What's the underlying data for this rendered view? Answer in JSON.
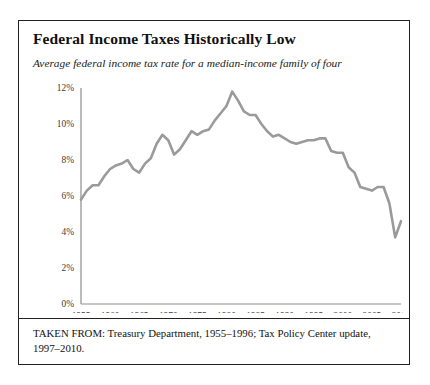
{
  "figure": {
    "title": "Federal Income Taxes Historically Low",
    "subtitle": "Average federal income tax rate for a median-income family of four",
    "caption": "TAKEN FROM: Treasury Department, 1955–1996; Tax Policy Center update, 1997–2010.",
    "border_color": "#231f20",
    "background": "#ffffff"
  },
  "chart_data": {
    "type": "line",
    "title": "Federal Income Taxes Historically Low",
    "subtitle": "Average federal income tax rate for a median-income family of four",
    "xlabel": "",
    "ylabel": "",
    "xlim": [
      1955,
      2010
    ],
    "ylim": [
      0,
      12
    ],
    "grid": false,
    "legend": "none",
    "line_color": "#9a9a9a",
    "line_width": 2.6,
    "y_ticks": [
      0,
      2,
      4,
      6,
      8,
      10,
      12
    ],
    "y_tick_labels": [
      "0%",
      "2%",
      "4%",
      "6%",
      "8%",
      "10%",
      "12%"
    ],
    "x_ticks": [
      1955,
      1960,
      1965,
      1970,
      1975,
      1980,
      1985,
      1990,
      1995,
      2000,
      2005,
      2010
    ],
    "x_tick_labels": [
      "1955",
      "1960",
      "1965",
      "1970",
      "1975",
      "1980",
      "1985",
      "1990",
      "1995",
      "2000",
      "2005",
      "2010"
    ],
    "x": [
      1955,
      1956,
      1957,
      1958,
      1959,
      1960,
      1961,
      1962,
      1963,
      1964,
      1965,
      1966,
      1967,
      1968,
      1969,
      1970,
      1971,
      1972,
      1973,
      1974,
      1975,
      1976,
      1977,
      1978,
      1979,
      1980,
      1981,
      1982,
      1983,
      1984,
      1985,
      1986,
      1987,
      1988,
      1989,
      1990,
      1991,
      1992,
      1993,
      1994,
      1995,
      1996,
      1997,
      1998,
      1999,
      2000,
      2001,
      2002,
      2003,
      2004,
      2005,
      2006,
      2007,
      2008,
      2009,
      2010
    ],
    "values": [
      5.8,
      6.3,
      6.6,
      6.6,
      7.1,
      7.5,
      7.7,
      7.8,
      8.0,
      7.5,
      7.3,
      7.8,
      8.1,
      8.9,
      9.4,
      9.1,
      8.3,
      8.6,
      9.1,
      9.6,
      9.4,
      9.6,
      9.7,
      10.2,
      10.6,
      11.0,
      11.8,
      11.3,
      10.7,
      10.5,
      10.5,
      10.0,
      9.6,
      9.3,
      9.4,
      9.2,
      9.0,
      8.9,
      9.0,
      9.1,
      9.1,
      9.2,
      9.2,
      8.5,
      8.4,
      8.4,
      7.6,
      7.3,
      6.5,
      6.4,
      6.3,
      6.5,
      6.5,
      5.6,
      3.7,
      4.6
    ],
    "series": [
      {
        "name": "Average federal income tax rate",
        "values": [
          5.8,
          6.3,
          6.6,
          6.6,
          7.1,
          7.5,
          7.7,
          7.8,
          8.0,
          7.5,
          7.3,
          7.8,
          8.1,
          8.9,
          9.4,
          9.1,
          8.3,
          8.6,
          9.1,
          9.6,
          9.4,
          9.6,
          9.7,
          10.2,
          10.6,
          11.0,
          11.8,
          11.3,
          10.7,
          10.5,
          10.5,
          10.0,
          9.6,
          9.3,
          9.4,
          9.2,
          9.0,
          8.9,
          9.0,
          9.1,
          9.1,
          9.2,
          9.2,
          8.5,
          8.4,
          8.4,
          7.6,
          7.3,
          6.5,
          6.4,
          6.3,
          6.5,
          6.5,
          5.6,
          3.7,
          4.6
        ]
      }
    ]
  }
}
